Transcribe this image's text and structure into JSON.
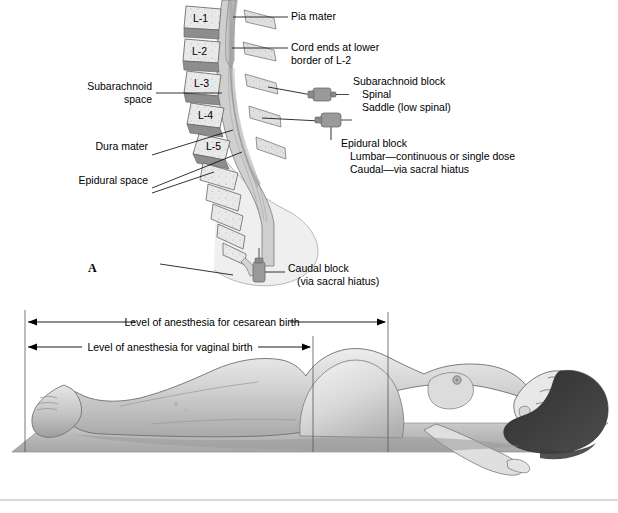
{
  "figure": {
    "panel_a": {
      "letter": "A",
      "vertebrae": [
        "L-1",
        "L-2",
        "L-3",
        "L-4",
        "L-5"
      ],
      "labels_right": [
        {
          "name": "pia-mater",
          "text": "Pia mater"
        },
        {
          "name": "cord-ends",
          "line1": "Cord ends at lower",
          "line2": "border of L-2"
        },
        {
          "name": "subarachnoid-block",
          "line1": "Subarachnoid block",
          "line2": "Spinal",
          "line3": "Saddle (low spinal)"
        },
        {
          "name": "epidural-block",
          "line1": "Epidural block",
          "line2": "Lumbar—continuous or single dose",
          "line3": "Caudal—via sacral hiatus"
        },
        {
          "name": "caudal-block",
          "line1": "Caudal block",
          "line2": "(via sacral hiatus)"
        }
      ],
      "labels_left": [
        {
          "name": "subarachnoid-space",
          "line1": "Subarachnoid",
          "line2": "space"
        },
        {
          "name": "dura-mater",
          "line1": "Dura mater"
        },
        {
          "name": "epidural-space",
          "line1": "Epidural space"
        }
      ]
    },
    "panel_b": {
      "dimension_cesarean": "Level of anesthesia for cesarean birth",
      "dimension_vaginal": "Level of anesthesia for vaginal birth"
    }
  },
  "colors": {
    "bone_light": "#e9e9e9",
    "disc_gray": "#8f8f8f",
    "cord_gray": "#b9b9b9",
    "canal_gray": "#cfcfcf",
    "skin_light": "#e3e3e3",
    "skin_mid": "#c9c9c9",
    "skin_shadow": "#a8a8a8",
    "hair_dark": "#3a3a3a",
    "mat_gray": "#b0b0b0",
    "mat_top": "#c6c6c6",
    "needle_gray": "#9a9a9a",
    "outline": "#000000",
    "rule": "#b5b5b5"
  }
}
